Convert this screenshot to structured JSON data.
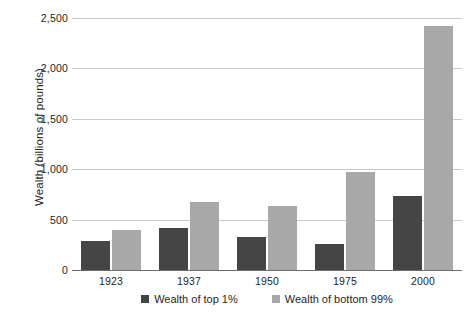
{
  "chart_data": {
    "type": "bar",
    "title": "",
    "xlabel": "",
    "ylabel": "Wealth (billions of pounds)",
    "categories": [
      "1923",
      "1937",
      "1950",
      "1975",
      "2000"
    ],
    "series": [
      {
        "name": "Wealth of top 1%",
        "color": "#454545",
        "values": [
          290,
          420,
          325,
          255,
          735
        ]
      },
      {
        "name": "Wealth of bottom 99%",
        "color": "#a8a8a8",
        "values": [
          395,
          670,
          635,
          975,
          2420
        ]
      }
    ],
    "ylim": [
      0,
      2500
    ],
    "yticks": [
      0,
      500,
      1000,
      1500,
      2000,
      2500
    ],
    "ytick_labels": [
      "0",
      "500",
      "1,000",
      "1,500",
      "2,000",
      "2,500"
    ],
    "grid": true,
    "legend_position": "bottom"
  }
}
